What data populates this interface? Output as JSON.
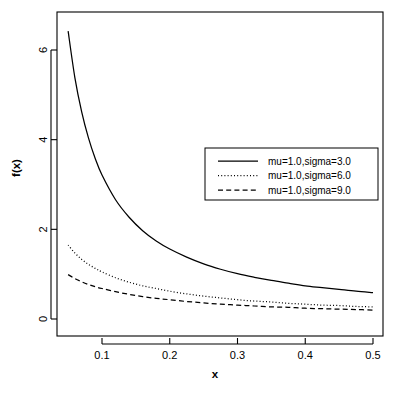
{
  "chart_data": {
    "type": "line",
    "title": "",
    "xlabel": "x",
    "ylabel": "f(x)",
    "xlim": [
      0.05,
      0.5
    ],
    "ylim": [
      0,
      6.8
    ],
    "grid": false,
    "legend_position": "upper-right-inside",
    "x_ticks": [
      "0.1",
      "0.2",
      "0.3",
      "0.4",
      "0.5"
    ],
    "x_tick_values": [
      0.1,
      0.2,
      0.3,
      0.4,
      0.5
    ],
    "y_ticks": [
      "0",
      "2",
      "4",
      "6"
    ],
    "y_tick_values": [
      0,
      2,
      4,
      6
    ],
    "x": [
      0.05,
      0.06,
      0.07,
      0.08,
      0.09,
      0.1,
      0.12,
      0.14,
      0.16,
      0.18,
      0.2,
      0.225,
      0.25,
      0.275,
      0.3,
      0.325,
      0.35,
      0.375,
      0.4,
      0.425,
      0.45,
      0.475,
      0.5
    ],
    "series": [
      {
        "name": "mu=1.0,sigma=3.0",
        "style": "solid",
        "color": "#000000",
        "values": [
          6.42,
          5.38,
          4.62,
          4.04,
          3.58,
          3.21,
          2.66,
          2.27,
          1.97,
          1.74,
          1.56,
          1.38,
          1.23,
          1.11,
          1.01,
          0.93,
          0.86,
          0.8,
          0.74,
          0.7,
          0.66,
          0.62,
          0.59
        ]
      },
      {
        "name": "mu=1.0,sigma=6.0",
        "style": "dotted",
        "color": "#000000",
        "values": [
          1.65,
          1.47,
          1.33,
          1.22,
          1.13,
          1.05,
          0.92,
          0.82,
          0.74,
          0.68,
          0.62,
          0.56,
          0.51,
          0.47,
          0.43,
          0.4,
          0.38,
          0.35,
          0.33,
          0.31,
          0.3,
          0.28,
          0.27
        ]
      },
      {
        "name": "mu=1.0,sigma=9.0",
        "style": "dashed",
        "color": "#000000",
        "values": [
          0.99,
          0.9,
          0.83,
          0.77,
          0.72,
          0.68,
          0.61,
          0.55,
          0.5,
          0.46,
          0.43,
          0.39,
          0.36,
          0.33,
          0.31,
          0.29,
          0.27,
          0.26,
          0.24,
          0.23,
          0.22,
          0.21,
          0.2
        ]
      }
    ],
    "legend": [
      {
        "label": "mu=1.0,sigma=3.0",
        "style": "solid"
      },
      {
        "label": "mu=1.0,sigma=6.0",
        "style": "dotted"
      },
      {
        "label": "mu=1.0,sigma=9.0",
        "style": "dashed"
      }
    ]
  }
}
